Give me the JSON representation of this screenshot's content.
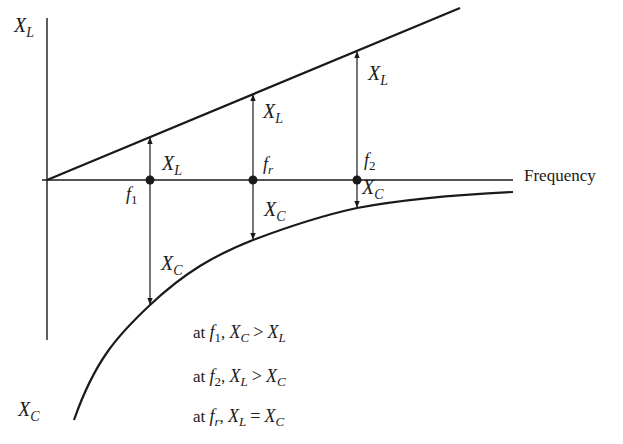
{
  "diagram": {
    "axes": {
      "y_top_label": {
        "main": "X",
        "sub": "L"
      },
      "y_bottom_label": {
        "main": "X",
        "sub": "C"
      },
      "x_label": "Frequency"
    },
    "points": [
      {
        "name": "f1",
        "main": "f",
        "sub": "1"
      },
      {
        "name": "fr",
        "main": "f",
        "sub": "r"
      },
      {
        "name": "f2",
        "main": "f",
        "sub": "2"
      }
    ],
    "arrow_labels": {
      "xl": {
        "main": "X",
        "sub": "L"
      },
      "xc": {
        "main": "X",
        "sub": "C"
      }
    },
    "notes": [
      {
        "prefix": "at",
        "f_main": "f",
        "f_sub": "1",
        "sep": ",",
        "a_main": "X",
        "a_sub": "C",
        "op": ">",
        "b_main": "X",
        "b_sub": "L"
      },
      {
        "prefix": "at",
        "f_main": "f",
        "f_sub": "2",
        "sep": ",",
        "a_main": "X",
        "a_sub": "L",
        "op": ">",
        "b_main": "X",
        "b_sub": "C"
      },
      {
        "prefix": "at",
        "f_main": "f",
        "f_sub": "r",
        "sep": ",",
        "a_main": "X",
        "a_sub": "L",
        "op": "=",
        "b_main": "X",
        "b_sub": "C"
      }
    ],
    "colors": {
      "ink": "#1a1a1a",
      "background": "#ffffff"
    }
  }
}
